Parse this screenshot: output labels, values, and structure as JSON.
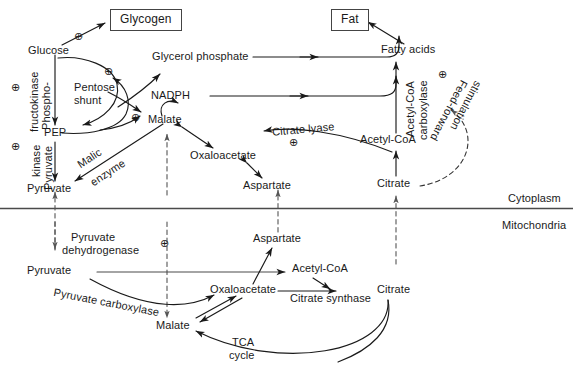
{
  "diagram": {
    "compartments": {
      "upper_label": "Cytoplasm",
      "lower_label": "Mitochondria"
    },
    "boxed_nodes": [
      {
        "id": "glycogen",
        "label": "Glycogen"
      },
      {
        "id": "fat",
        "label": "Fat"
      }
    ],
    "metabolites": {
      "glucose": "Glucose",
      "pep": "PEP",
      "pyruvate_cyto": "Pyruvate",
      "pentose_shunt": "Pentose\nshunt",
      "pentose_shunt_line1": "Pentose",
      "pentose_shunt_line2": "shunt",
      "glycerol_phosphate": "Glycerol phosphate",
      "nadph": "NADPH",
      "malate_cyto": "Malate",
      "oxaloacetate_cyto": "Oxaloacetate",
      "aspartate_cyto": "Aspartate",
      "citrate_cyto": "Citrate",
      "acetyl_coa_cyto": "Acetyl-CoA",
      "fatty_acids": "Fatty acids",
      "pyruvate_mito": "Pyruvate",
      "aspartate_mito": "Aspartate",
      "oxaloacetate_mito": "Oxaloacetate",
      "acetyl_coa_mito": "Acetyl-CoA",
      "citrate_mito": "Citrate",
      "malate_mito": "Malate"
    },
    "enzymes": {
      "phosphofructokinase_l1": "Phospho-",
      "phosphofructokinase_l2": "fructokinase",
      "pyruvate_kinase_l1": "Pyruvate",
      "pyruvate_kinase_l2": "kinase",
      "malic_enzyme_l1": "Malic",
      "malic_enzyme_l2": "enzyme",
      "citrate_lyase": "Citrate lyase",
      "acetyl_coa_carboxylase_l1": "Acetyl-CoA",
      "acetyl_coa_carboxylase_l2": "carboxylase",
      "pyruvate_dehydrogenase_l1": "Pyruvate",
      "pyruvate_dehydrogenase_l2": "dehydrogenase",
      "pyruvate_carboxylase": "Pyruvate carboxylase",
      "citrate_synthase": "Citrate synthase"
    },
    "annotations": {
      "tca_cycle_l1": "TCA",
      "tca_cycle_l2": "cycle",
      "feed_forward_l1": "Feed-forward",
      "feed_forward_l2": "stimulation"
    },
    "activation_symbol": "⊕",
    "activation_markers": [
      {
        "id": "glycogen-synthesis",
        "near": "Glucose → Glycogen"
      },
      {
        "id": "phosphofructokinase",
        "near": "Phospho-fructokinase"
      },
      {
        "id": "pyruvate-kinase",
        "near": "Pyruvate kinase"
      },
      {
        "id": "pentose-shunt",
        "near": "Pentose shunt"
      },
      {
        "id": "malic-enzyme",
        "near": "Malic enzyme / Malate"
      },
      {
        "id": "citrate-lyase",
        "near": "Citrate lyase"
      },
      {
        "id": "acetyl-coa-carboxylase",
        "near": "Acetyl-CoA carboxylase"
      },
      {
        "id": "pyruvate-dehydrogenase",
        "near": "Pyruvate dehydrogenase"
      }
    ],
    "colors": {
      "stroke": "#1a1a1a",
      "membrane": "#4a4a4a",
      "dashed": "#555555",
      "background": "#ffffff"
    }
  }
}
